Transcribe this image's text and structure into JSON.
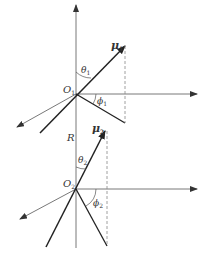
{
  "diagram": {
    "title": "",
    "labels": {
      "mu1": "μ",
      "mu1_sub": "1",
      "mu2": "μ",
      "mu2_sub": "2",
      "O1": "O",
      "O1_sub": "1",
      "O2": "O",
      "O2_sub": "2",
      "theta1": "θ",
      "theta1_sub": "1",
      "theta2": "θ",
      "theta2_sub": "2",
      "phi1": "ϕ",
      "phi1_sub": "1",
      "phi2": "ϕ",
      "phi2_sub": "2",
      "R": "R"
    },
    "colors": {
      "line": "#333333",
      "thin": "#555555",
      "dashed": "#888888"
    }
  }
}
